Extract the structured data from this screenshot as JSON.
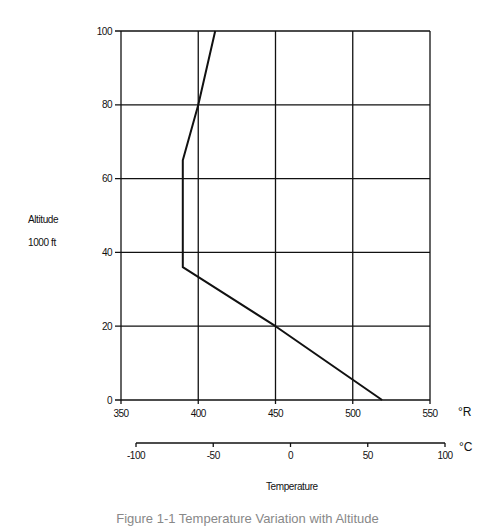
{
  "chart_data": {
    "type": "line",
    "title": "",
    "ylabel": "Altitude",
    "ylabel_unit": "1000 ft",
    "xlabel": "Temperature",
    "x_primary_unit": "°R",
    "x_secondary_unit": "°C",
    "xlim": [
      350,
      550
    ],
    "ylim": [
      0,
      100
    ],
    "x_ticks": [
      350,
      400,
      450,
      500,
      550
    ],
    "y_ticks": [
      0,
      20,
      40,
      60,
      80,
      100
    ],
    "x_secondary_ticks": [
      -100,
      -50,
      0,
      50,
      100
    ],
    "x_secondary_range": [
      -100,
      100
    ],
    "grid": true,
    "legend": "none",
    "series": [
      {
        "name": "Standard atmosphere temperature",
        "points": [
          {
            "temp_R": 519,
            "alt_kft": 0
          },
          {
            "temp_R": 450,
            "alt_kft": 20
          },
          {
            "temp_R": 390,
            "alt_kft": 36
          },
          {
            "temp_R": 390,
            "alt_kft": 65
          },
          {
            "temp_R": 400,
            "alt_kft": 80
          },
          {
            "temp_R": 411,
            "alt_kft": 100
          }
        ]
      }
    ]
  },
  "labels": {
    "y_title": "Altitude",
    "y_unit": "1000 ft",
    "x_title": "Temperature",
    "unit_R": "°R",
    "unit_C": "°C",
    "caption": "Figure 1-1 Temperature Variation with Altitude"
  },
  "colors": {
    "ink": "#111111",
    "caption": "#888888"
  }
}
